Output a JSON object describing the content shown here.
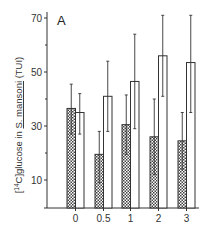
{
  "chart_data": {
    "type": "bar",
    "panel_label": "A",
    "title": "",
    "xlabel": "",
    "ylabel": "[14C]glucose in S. mansoni (TUI)",
    "ylabel_parts": {
      "prefix": "[",
      "sup": "14",
      "mid": "C]glucose in ",
      "underlined": "S. mansoni",
      "suffix": " (TUI)"
    },
    "ylim": [
      0,
      72
    ],
    "yticks": [
      10,
      30,
      50,
      70
    ],
    "yticks_minor": [
      20,
      40,
      60
    ],
    "categories": [
      "0",
      "0.5",
      "1",
      "2",
      "3"
    ],
    "series": [
      {
        "name": "hatched",
        "pattern": "crosshatch",
        "values": [
          36.5,
          19.5,
          30.5,
          26,
          24.5
        ],
        "err_upper": [
          45.5,
          28,
          41.5,
          40,
          35
        ],
        "err_lower": [
          27,
          9,
          19.5,
          12,
          14
        ]
      },
      {
        "name": "open",
        "pattern": "none",
        "values": [
          35,
          41,
          46.5,
          56,
          53.5
        ],
        "err_upper": [
          42,
          54,
          64,
          71,
          71
        ],
        "err_lower": [
          27,
          28,
          29,
          41,
          35
        ]
      }
    ],
    "grid": false,
    "legend": null
  },
  "colors": {
    "ink": "#333333",
    "hatch_dark": "#555555",
    "background": "#ffffff"
  }
}
